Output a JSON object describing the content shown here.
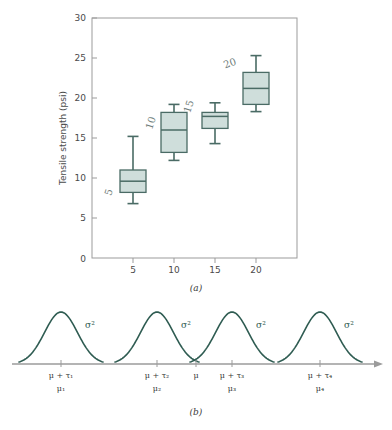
{
  "figure": {
    "panel_a_caption": "(a)",
    "panel_b_caption": "(b)"
  },
  "colors": {
    "box_fill": "#cfdedb",
    "box_stroke": "#4a6b65",
    "curve_stroke": "#2f5c52",
    "axis": "#8a8a8a",
    "text": "#4a4a4a",
    "hand_annotation": "#6f7d7a"
  },
  "chart_data": {
    "type": "boxplot",
    "title": "",
    "xlabel": "Hardwood concentration (%)",
    "ylabel": "Tensile strength (psi)",
    "xlim": [
      2.5,
      22.5
    ],
    "ylim": [
      5,
      30
    ],
    "y_axis_break_zero": true,
    "grid": false,
    "legend": "none",
    "yticks": [
      "0",
      "5",
      "10",
      "15",
      "20",
      "25",
      "30"
    ],
    "ytick_values": [
      0,
      5,
      10,
      15,
      20,
      25,
      30
    ],
    "xticks": [
      "5",
      "10",
      "15",
      "20"
    ],
    "xtick_values": [
      5,
      10,
      15,
      20
    ],
    "categories": [
      5,
      10,
      15,
      20
    ],
    "boxes": [
      {
        "category": 5,
        "min": 6.8,
        "q1": 8.2,
        "median": 9.6,
        "q3": 11.0,
        "max": 15.2,
        "annotation": "5"
      },
      {
        "category": 10,
        "min": 12.2,
        "q1": 13.2,
        "median": 16.0,
        "q3": 18.2,
        "max": 19.2,
        "annotation": "10"
      },
      {
        "category": 15,
        "min": 14.3,
        "q1": 16.2,
        "median": 17.7,
        "q3": 18.2,
        "max": 19.4,
        "annotation": "15"
      },
      {
        "category": 20,
        "min": 18.3,
        "q1": 19.2,
        "median": 21.2,
        "q3": 23.2,
        "max": 25.3,
        "annotation": "20"
      }
    ]
  },
  "chart_data_b": {
    "type": "line",
    "description": "Four normal density curves on a common axis",
    "xlabel": "",
    "ylabel": "",
    "grid": false,
    "legend": "none",
    "curves": [
      {
        "name": "curve-1",
        "variance_label": "σ²",
        "center_label": "μ + τ₁",
        "mean_label": "μ₁"
      },
      {
        "name": "curve-2",
        "variance_label": "σ²",
        "center_label": "μ + τ₂",
        "mean_label": "μ₂"
      },
      {
        "name": "curve-3",
        "variance_label": "σ²",
        "center_label": "μ + τ₃",
        "mean_label": "μ₃"
      },
      {
        "name": "curve-4",
        "variance_label": "σ²",
        "center_label": "μ + τ₄",
        "mean_label": "μ₄"
      }
    ],
    "grand_mean_label": "μ"
  }
}
